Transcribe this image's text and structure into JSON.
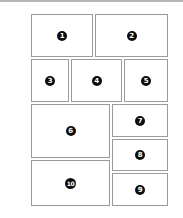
{
  "layout": {
    "title": "Panel layout diagram",
    "panels": [
      {
        "label": "1",
        "x": 31,
        "y": 14,
        "w": 62,
        "h": 43
      },
      {
        "label": "2",
        "x": 95,
        "y": 14,
        "w": 73,
        "h": 43
      },
      {
        "label": "3",
        "x": 31,
        "y": 59,
        "w": 38,
        "h": 43
      },
      {
        "label": "4",
        "x": 71,
        "y": 59,
        "w": 51,
        "h": 43
      },
      {
        "label": "5",
        "x": 124,
        "y": 59,
        "w": 44,
        "h": 43
      },
      {
        "label": "6",
        "x": 31,
        "y": 104,
        "w": 79,
        "h": 54
      },
      {
        "label": "7",
        "x": 112,
        "y": 104,
        "w": 56,
        "h": 33
      },
      {
        "label": "8",
        "x": 112,
        "y": 139,
        "w": 56,
        "h": 32
      },
      {
        "label": "9",
        "x": 112,
        "y": 173,
        "w": 56,
        "h": 33
      },
      {
        "label": "10",
        "x": 31,
        "y": 160,
        "w": 79,
        "h": 46
      }
    ]
  },
  "colors": {
    "border": "#9a9a9a",
    "badge": "#0d0d0d",
    "badge_text": "#ffffff",
    "background": "#ffffff"
  }
}
